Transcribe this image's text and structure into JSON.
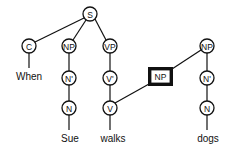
{
  "diagram": {
    "type": "syntax-tree",
    "nodes": [
      {
        "id": "S",
        "label": "S",
        "x": 90,
        "y": 14,
        "shape": "circle"
      },
      {
        "id": "C",
        "label": "C",
        "x": 29,
        "y": 46,
        "shape": "circle"
      },
      {
        "id": "NP1",
        "label": "NP",
        "x": 69,
        "y": 46,
        "shape": "circle"
      },
      {
        "id": "VP",
        "label": "VP",
        "x": 110,
        "y": 46,
        "shape": "circle"
      },
      {
        "id": "N1bar",
        "label": "N'",
        "x": 69,
        "y": 78,
        "shape": "circle"
      },
      {
        "id": "Vbar",
        "label": "V'",
        "x": 110,
        "y": 78,
        "shape": "circle"
      },
      {
        "id": "N1",
        "label": "N",
        "x": 69,
        "y": 108,
        "shape": "circle"
      },
      {
        "id": "V",
        "label": "V",
        "x": 110,
        "y": 108,
        "shape": "circle"
      },
      {
        "id": "NPbox",
        "label": "NP",
        "x": 160,
        "y": 76,
        "shape": "box"
      },
      {
        "id": "NP2",
        "label": "NP",
        "x": 207,
        "y": 46,
        "shape": "circle"
      },
      {
        "id": "N2bar",
        "label": "N'",
        "x": 207,
        "y": 78,
        "shape": "circle"
      },
      {
        "id": "N2",
        "label": "N",
        "x": 207,
        "y": 108,
        "shape": "circle"
      }
    ],
    "words": [
      {
        "text": "When",
        "x": 29,
        "y": 80
      },
      {
        "text": "Sue",
        "x": 70,
        "y": 142
      },
      {
        "text": "walks",
        "x": 113,
        "y": 142
      },
      {
        "text": "dogs",
        "x": 208,
        "y": 142
      }
    ]
  }
}
